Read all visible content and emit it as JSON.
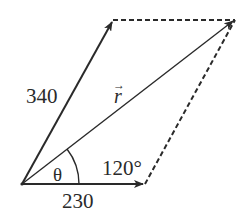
{
  "diagram": {
    "colors": {
      "vector": "#2a2a2a",
      "dashed": "#2a2a2a",
      "background": "#ffffff"
    },
    "origin": {
      "x": 22,
      "y": 184
    },
    "vectors": [
      {
        "id": "a",
        "label": "340",
        "from": [
          22,
          184
        ],
        "to": [
          113,
          20
        ],
        "style": "solid-arrow"
      },
      {
        "id": "b",
        "label": "230",
        "from": [
          22,
          184
        ],
        "to": [
          145,
          184
        ],
        "style": "solid-arrow"
      },
      {
        "id": "r",
        "label": "r",
        "label_accent": "→",
        "from": [
          22,
          184
        ],
        "to": [
          235,
          20
        ],
        "style": "solid-arrow"
      }
    ],
    "dashed_edges": [
      {
        "from": [
          113,
          20
        ],
        "to": [
          235,
          20
        ]
      },
      {
        "from": [
          145,
          184
        ],
        "to": [
          235,
          20
        ]
      }
    ],
    "labels": {
      "vector_a": "340",
      "vector_b": "230",
      "resultant": "r",
      "resultant_accent": "→",
      "angle_theta": "θ",
      "angle_obtuse": "120°"
    }
  }
}
